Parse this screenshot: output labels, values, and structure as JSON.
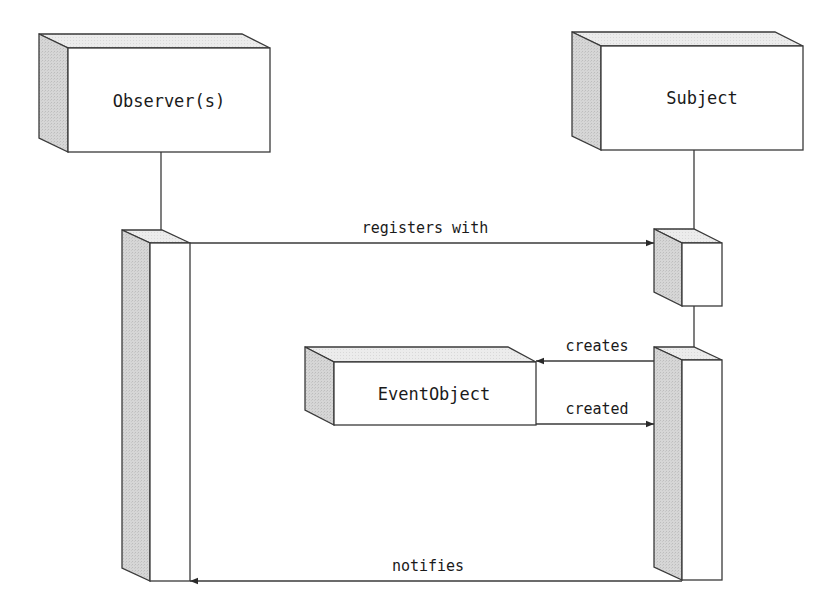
{
  "diagram": {
    "type": "sequence",
    "participants": [
      {
        "id": "observer",
        "label": "Observer(s)"
      },
      {
        "id": "subject",
        "label": "Subject"
      },
      {
        "id": "eventobject",
        "label": "EventObject"
      }
    ],
    "messages": [
      {
        "from": "observer",
        "to": "subject",
        "label": "registers with"
      },
      {
        "from": "subject",
        "to": "eventobject",
        "label": "creates"
      },
      {
        "from": "eventobject",
        "to": "subject",
        "label": "created"
      },
      {
        "from": "subject",
        "to": "observer",
        "label": "notifies"
      }
    ]
  },
  "colors": {
    "stroke": "#3a3a3a",
    "side_face": "#d4d4d4",
    "top_face": "#ebebeb",
    "front_face": "#ffffff"
  }
}
